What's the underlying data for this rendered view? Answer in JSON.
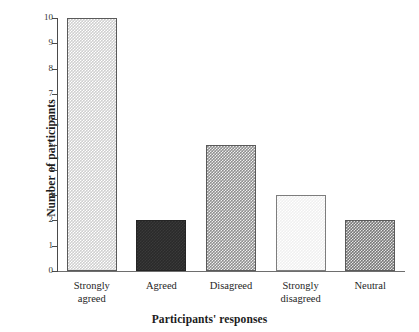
{
  "chart_data": {
    "type": "bar",
    "title": "",
    "categories": [
      "Strongly agreed",
      "Agreed",
      "Disagreed",
      "Strongly disagreed",
      "Neutral"
    ],
    "values": [
      10,
      2,
      5,
      3,
      2
    ],
    "xlabel": "Participants' responses",
    "ylabel": "Number of participants",
    "ylim": [
      0,
      10
    ],
    "ytick_labels": [
      "10",
      "9",
      "8",
      "7",
      "6",
      "5",
      "4",
      "3",
      "2",
      "1",
      "0"
    ],
    "grid": false,
    "legend": false,
    "bar_styles": [
      {
        "name": "light-checker",
        "color": "#cfcfcf"
      },
      {
        "name": "solid-dark",
        "color": "#2a2a2a"
      },
      {
        "name": "mid-checker",
        "color": "#8f8f8f"
      },
      {
        "name": "very-light-dotted",
        "color": "#f0f0f0"
      },
      {
        "name": "dark-checker",
        "color": "#787878"
      }
    ],
    "bars": [
      {
        "category": "Strongly agreed",
        "label_line1": "Strongly",
        "label_line2": "agreed",
        "value": 10,
        "style": "tex-light-check"
      },
      {
        "category": "Agreed",
        "label_line1": "Agreed",
        "label_line2": "",
        "value": 2,
        "style": "tex-solid-dark"
      },
      {
        "category": "Disagreed",
        "label_line1": "Disagreed",
        "label_line2": "",
        "value": 5,
        "style": "tex-mid-check"
      },
      {
        "category": "Strongly disagreed",
        "label_line1": "Strongly",
        "label_line2": "disagreed",
        "value": 3,
        "style": "tex-verylight-dot"
      },
      {
        "category": "Neutral",
        "label_line1": "Neutral",
        "label_line2": "",
        "value": 2,
        "style": "tex-dark-check"
      }
    ]
  },
  "axes": {
    "y_title": "Number of participants",
    "x_title": "Participants' responses"
  }
}
